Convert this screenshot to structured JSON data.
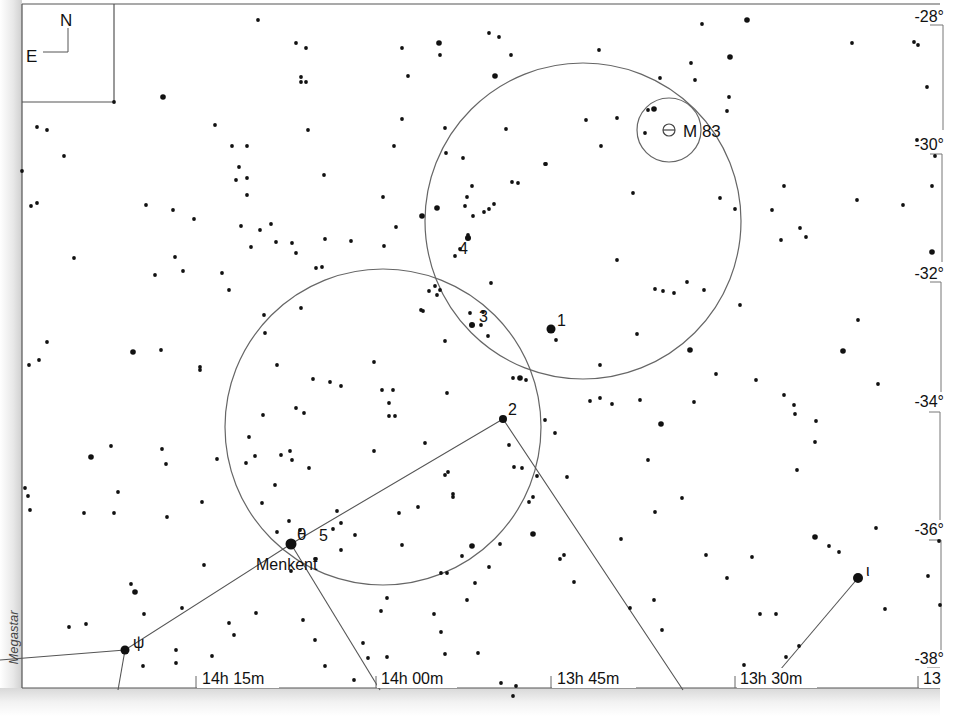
{
  "chart_data": {
    "type": "star-chart",
    "credit": "Megastar",
    "orientation": {
      "north": "N",
      "east": "E"
    },
    "ra_axis": {
      "labels": [
        "14h 15m",
        "14h 00m",
        "13h 45m",
        "13h 30m",
        "13"
      ],
      "label_x": [
        200,
        380,
        555,
        740,
        922
      ]
    },
    "dec_axis": {
      "labels": [
        "-28°",
        "-30°",
        "-32°",
        "-34°",
        "-36°",
        "-38°"
      ],
      "label_y": [
        18,
        146,
        275,
        402,
        531,
        659
      ]
    },
    "labeled_objects": [
      {
        "name": "M 83",
        "type": "galaxy",
        "x": 669,
        "y": 130
      },
      {
        "name": "Menkent",
        "greek": "θ",
        "x": 291,
        "y": 544
      },
      {
        "name": "ψ",
        "x": 125,
        "y": 650
      },
      {
        "name": "ι",
        "x": 858,
        "y": 578
      },
      {
        "name": "5",
        "x": 305,
        "y": 533
      }
    ],
    "hop_stars": [
      {
        "label": "1",
        "x": 551,
        "y": 329
      },
      {
        "label": "2",
        "x": 503,
        "y": 419
      },
      {
        "label": "3",
        "x": 472,
        "y": 325
      },
      {
        "label": "4",
        "x": 468,
        "y": 238
      }
    ],
    "finder_circles": [
      {
        "name": "field-around-menkent",
        "cx": 383,
        "cy": 427,
        "r": 158
      },
      {
        "name": "field-around-m83",
        "cx": 583,
        "cy": 221,
        "r": 158
      },
      {
        "name": "eyepiece-m83",
        "cx": 669,
        "cy": 130,
        "r": 32
      }
    ],
    "constellation_lines": [
      [
        [
          0,
          660
        ],
        [
          125,
          650
        ],
        [
          291,
          544
        ],
        [
          503,
          419
        ],
        [
          683,
          690
        ]
      ],
      [
        [
          125,
          650
        ],
        [
          118,
          690
        ]
      ],
      [
        [
          291,
          544
        ],
        [
          380,
          690
        ]
      ],
      [
        [
          858,
          578
        ],
        [
          780,
          670
        ]
      ]
    ]
  },
  "stars": [
    [
      114,
      102,
      2
    ],
    [
      163,
      97,
      3
    ],
    [
      37,
      127,
      2
    ],
    [
      47,
      130,
      2
    ],
    [
      64,
      156,
      2
    ],
    [
      22,
      171,
      2
    ],
    [
      31,
      206,
      2
    ],
    [
      37,
      203,
      2
    ],
    [
      74,
      258,
      2
    ],
    [
      146,
      205,
      2
    ],
    [
      173,
      210,
      2
    ],
    [
      194,
      219,
      2
    ],
    [
      175,
      257,
      2
    ],
    [
      155,
      275,
      2
    ],
    [
      183,
      271,
      2
    ],
    [
      222,
      273,
      2
    ],
    [
      229,
      290,
      2
    ],
    [
      215,
      125,
      2
    ],
    [
      232,
      146,
      2
    ],
    [
      247,
      146,
      2
    ],
    [
      239,
      167,
      2
    ],
    [
      236,
      180,
      2
    ],
    [
      247,
      178,
      2
    ],
    [
      258,
      20,
      2
    ],
    [
      296,
      43,
      2
    ],
    [
      306,
      48,
      2
    ],
    [
      301,
      77,
      2
    ],
    [
      306,
      82,
      2
    ],
    [
      301,
      82,
      2
    ],
    [
      402,
      48,
      2
    ],
    [
      439,
      43,
      3
    ],
    [
      440,
      55,
      2
    ],
    [
      408,
      76,
      2
    ],
    [
      402,
      119,
      2
    ],
    [
      394,
      146,
      2
    ],
    [
      308,
      130,
      2
    ],
    [
      324,
      175,
      2
    ],
    [
      247,
      195,
      2
    ],
    [
      271,
      224,
      2
    ],
    [
      241,
      226,
      2
    ],
    [
      276,
      242,
      2
    ],
    [
      251,
      247,
      2
    ],
    [
      260,
      230,
      2
    ],
    [
      292,
      243,
      2
    ],
    [
      325,
      239,
      2
    ],
    [
      351,
      241,
      2
    ],
    [
      383,
      197,
      2
    ],
    [
      396,
      227,
      2
    ],
    [
      384,
      246,
      2
    ],
    [
      422,
      216,
      3
    ],
    [
      437,
      208,
      3
    ],
    [
      445,
      128,
      2
    ],
    [
      446,
      153,
      2
    ],
    [
      463,
      158,
      2
    ],
    [
      472,
      186,
      2
    ],
    [
      467,
      197,
      2
    ],
    [
      473,
      216,
      2
    ],
    [
      484,
      212,
      2
    ],
    [
      489,
      209,
      2
    ],
    [
      494,
      204,
      2
    ],
    [
      460,
      249,
      2
    ],
    [
      455,
      256,
      2
    ],
    [
      435,
      286,
      2
    ],
    [
      440,
      290,
      2
    ],
    [
      421,
      310,
      2
    ],
    [
      423,
      311,
      2
    ],
    [
      483,
      312,
      2
    ],
    [
      488,
      336,
      2
    ],
    [
      546,
      164,
      2
    ],
    [
      556,
      340,
      2
    ],
    [
      617,
      260,
      2
    ],
    [
      600,
      365,
      2
    ],
    [
      637,
      334,
      2
    ],
    [
      655,
      289,
      2
    ],
    [
      663,
      291,
      2
    ],
    [
      674,
      293,
      2
    ],
    [
      687,
      282,
      2
    ],
    [
      704,
      290,
      2
    ],
    [
      690,
      350,
      3
    ],
    [
      740,
      305,
      2
    ],
    [
      756,
      380,
      2
    ],
    [
      784,
      395,
      2
    ],
    [
      794,
      405,
      2
    ],
    [
      716,
      374,
      2
    ],
    [
      720,
      198,
      2
    ],
    [
      735,
      209,
      2
    ],
    [
      772,
      210,
      2
    ],
    [
      784,
      186,
      2
    ],
    [
      800,
      228,
      2
    ],
    [
      781,
      240,
      2
    ],
    [
      806,
      237,
      2
    ],
    [
      857,
      200,
      2
    ],
    [
      903,
      205,
      2
    ],
    [
      858,
      320,
      2
    ],
    [
      878,
      384,
      2
    ],
    [
      843,
      351,
      3
    ],
    [
      932,
      252,
      3
    ],
    [
      932,
      186,
      2
    ],
    [
      935,
      156,
      2
    ],
    [
      917,
      140,
      2
    ],
    [
      927,
      87,
      2
    ],
    [
      918,
      45,
      2
    ],
    [
      914,
      42,
      2
    ],
    [
      852,
      43,
      2
    ],
    [
      747,
      20,
      3
    ],
    [
      730,
      57,
      3
    ],
    [
      729,
      97,
      2
    ],
    [
      727,
      111,
      2
    ],
    [
      702,
      24,
      2
    ],
    [
      691,
      63,
      2
    ],
    [
      695,
      80,
      2
    ],
    [
      660,
      78,
      2
    ],
    [
      648,
      110,
      2
    ],
    [
      654,
      109,
      3
    ],
    [
      645,
      133,
      2
    ],
    [
      617,
      118,
      2
    ],
    [
      633,
      193,
      2
    ],
    [
      599,
      50,
      2
    ],
    [
      545,
      164,
      2
    ],
    [
      495,
      76,
      3
    ],
    [
      489,
      33,
      2
    ],
    [
      499,
      37,
      2
    ],
    [
      511,
      55,
      2
    ],
    [
      586,
      120,
      2
    ],
    [
      601,
      146,
      2
    ],
    [
      506,
      129,
      2
    ],
    [
      512,
      182,
      2
    ],
    [
      518,
      183,
      2
    ],
    [
      465,
      206,
      2
    ],
    [
      468,
      235,
      2
    ],
    [
      491,
      283,
      2
    ],
    [
      481,
      325,
      2
    ],
    [
      470,
      313,
      2
    ],
    [
      545,
      420,
      2
    ],
    [
      555,
      433,
      2
    ],
    [
      590,
      401,
      2
    ],
    [
      600,
      398,
      2
    ],
    [
      612,
      404,
      2
    ],
    [
      640,
      400,
      2
    ],
    [
      661,
      424,
      3
    ],
    [
      694,
      402,
      2
    ],
    [
      795,
      414,
      2
    ],
    [
      816,
      421,
      2
    ],
    [
      815,
      442,
      2
    ],
    [
      797,
      470,
      2
    ],
    [
      682,
      498,
      2
    ],
    [
      648,
      460,
      2
    ],
    [
      655,
      512,
      2
    ],
    [
      621,
      539,
      2
    ],
    [
      560,
      559,
      2
    ],
    [
      564,
      555,
      2
    ],
    [
      533,
      497,
      2
    ],
    [
      537,
      476,
      2
    ],
    [
      567,
      477,
      2
    ],
    [
      574,
      582,
      2
    ],
    [
      706,
      555,
      2
    ],
    [
      727,
      578,
      2
    ],
    [
      752,
      557,
      2
    ],
    [
      744,
      665,
      2
    ],
    [
      786,
      657,
      2
    ],
    [
      839,
      552,
      2
    ],
    [
      829,
      546,
      2
    ],
    [
      815,
      537,
      3
    ],
    [
      876,
      528,
      2
    ],
    [
      939,
      541,
      2
    ],
    [
      928,
      576,
      2
    ],
    [
      940,
      605,
      2
    ],
    [
      885,
      609,
      2
    ],
    [
      799,
      646,
      2
    ],
    [
      776,
      614,
      2
    ],
    [
      760,
      614,
      2
    ],
    [
      654,
      600,
      2
    ],
    [
      662,
      630,
      2
    ],
    [
      630,
      608,
      2
    ],
    [
      529,
      502,
      2
    ],
    [
      533,
      534,
      3
    ],
    [
      500,
      544,
      2
    ],
    [
      462,
      556,
      2
    ],
    [
      467,
      600,
      2
    ],
    [
      478,
      653,
      2
    ],
    [
      513,
      696,
      2
    ],
    [
      516,
      686,
      2
    ],
    [
      501,
      683,
      2
    ],
    [
      450,
      684,
      2
    ],
    [
      445,
      654,
      2
    ],
    [
      441,
      632,
      2
    ],
    [
      434,
      614,
      2
    ],
    [
      387,
      598,
      2
    ],
    [
      381,
      611,
      2
    ],
    [
      363,
      643,
      2
    ],
    [
      368,
      658,
      2
    ],
    [
      325,
      666,
      2
    ],
    [
      354,
      680,
      2
    ],
    [
      387,
      657,
      2
    ],
    [
      315,
      640,
      2
    ],
    [
      303,
      620,
      2
    ],
    [
      256,
      613,
      2
    ],
    [
      234,
      635,
      2
    ],
    [
      229,
      623,
      2
    ],
    [
      176,
      650,
      2
    ],
    [
      212,
      656,
      2
    ],
    [
      176,
      663,
      2
    ],
    [
      143,
      666,
      2
    ],
    [
      69,
      627,
      2
    ],
    [
      86,
      624,
      2
    ],
    [
      131,
      584,
      2
    ],
    [
      135,
      592,
      3
    ],
    [
      144,
      614,
      2
    ],
    [
      182,
      608,
      2
    ],
    [
      28,
      496,
      2
    ],
    [
      30,
      510,
      2
    ],
    [
      84,
      513,
      2
    ],
    [
      118,
      492,
      2
    ],
    [
      114,
      513,
      2
    ],
    [
      111,
      446,
      2
    ],
    [
      91,
      457,
      3
    ],
    [
      133,
      352,
      3
    ],
    [
      161,
      350,
      2
    ],
    [
      200,
      367,
      2
    ],
    [
      200,
      370,
      2
    ],
    [
      166,
      464,
      2
    ],
    [
      162,
      449,
      2
    ],
    [
      217,
      459,
      2
    ],
    [
      202,
      502,
      2
    ],
    [
      167,
      517,
      2
    ],
    [
      204,
      565,
      2
    ],
    [
      246,
      463,
      2
    ],
    [
      275,
      485,
      2
    ],
    [
      277,
      532,
      2
    ],
    [
      262,
      503,
      2
    ],
    [
      292,
      460,
      2
    ],
    [
      290,
      451,
      2
    ],
    [
      309,
      468,
      2
    ],
    [
      337,
      511,
      2
    ],
    [
      333,
      529,
      2
    ],
    [
      355,
      535,
      2
    ],
    [
      374,
      451,
      2
    ],
    [
      341,
      550,
      2
    ],
    [
      289,
      521,
      2
    ],
    [
      316,
      559,
      2
    ],
    [
      291,
      571,
      2
    ],
    [
      315,
      559,
      2
    ],
    [
      300,
      530,
      2
    ],
    [
      341,
      523,
      2
    ],
    [
      304,
      413,
      2
    ],
    [
      296,
      408,
      2
    ],
    [
      313,
      379,
      2
    ],
    [
      330,
      382,
      2
    ],
    [
      249,
      437,
      2
    ],
    [
      255,
      456,
      2
    ],
    [
      263,
      415,
      2
    ],
    [
      281,
      455,
      2
    ],
    [
      341,
      386,
      2
    ],
    [
      382,
      390,
      2
    ],
    [
      393,
      390,
      2
    ],
    [
      389,
      403,
      2
    ],
    [
      389,
      416,
      2
    ],
    [
      395,
      416,
      2
    ],
    [
      374,
      362,
      2
    ],
    [
      301,
      308,
      2
    ],
    [
      265,
      333,
      2
    ],
    [
      264,
      315,
      2
    ],
    [
      277,
      365,
      2
    ],
    [
      296,
      253,
      2
    ],
    [
      316,
      268,
      2
    ],
    [
      322,
      267,
      2
    ],
    [
      429,
      291,
      2
    ],
    [
      437,
      295,
      2
    ],
    [
      445,
      341,
      2
    ],
    [
      447,
      393,
      2
    ],
    [
      448,
      472,
      2
    ],
    [
      445,
      475,
      2
    ],
    [
      425,
      443,
      2
    ],
    [
      453,
      494,
      2
    ],
    [
      453,
      497,
      2
    ],
    [
      418,
      507,
      2
    ],
    [
      399,
      513,
      2
    ],
    [
      402,
      545,
      2
    ],
    [
      441,
      573,
      2
    ],
    [
      447,
      573,
      2
    ],
    [
      472,
      546,
      3
    ],
    [
      489,
      567,
      2
    ],
    [
      475,
      583,
      2
    ],
    [
      514,
      467,
      2
    ],
    [
      522,
      468,
      2
    ],
    [
      520,
      378,
      3
    ],
    [
      526,
      380,
      2
    ],
    [
      513,
      378,
      2
    ],
    [
      509,
      445,
      2
    ],
    [
      39,
      360,
      2
    ],
    [
      47,
      342,
      2
    ],
    [
      29,
      365,
      2
    ],
    [
      25,
      488,
      2
    ]
  ]
}
